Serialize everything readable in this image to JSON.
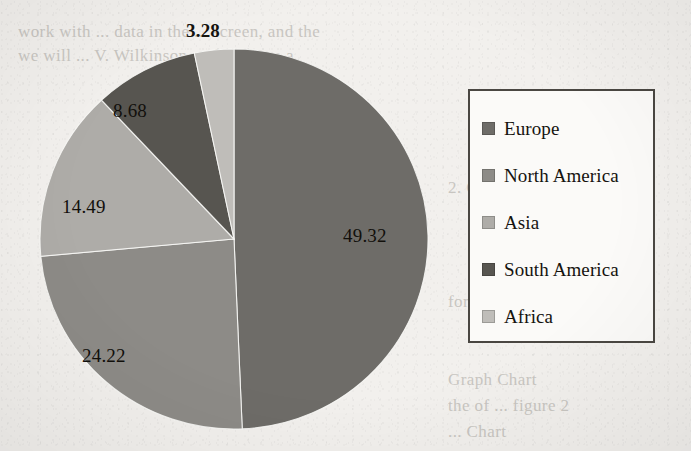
{
  "document": {
    "type": "scanned-page-with-figure",
    "background_color": "#f2f0ed",
    "bleed_through_lines": [
      {
        "text": "work with ... data in the ... screen, and the",
        "x": 18,
        "y": 22,
        "size": 17
      },
      {
        "text": "we will ... V. Wilkinson ... data learn a",
        "x": 18,
        "y": 46,
        "size": 17
      },
      {
        "text": "2. GRAPH A",
        "x": 448,
        "y": 178,
        "size": 17
      },
      {
        "text": "for all ... the",
        "x": 448,
        "y": 292,
        "size": 17
      },
      {
        "text": "Graph      Chart",
        "x": 448,
        "y": 370,
        "size": 17
      },
      {
        "text": "the    of    ... figure 2",
        "x": 448,
        "y": 396,
        "size": 17
      },
      {
        "text": "... Chart",
        "x": 448,
        "y": 422,
        "size": 17
      }
    ]
  },
  "chart_data": {
    "type": "pie",
    "title": "",
    "categories": [
      "Europe",
      "North America",
      "Asia",
      "South America",
      "Africa"
    ],
    "values": [
      49.32,
      24.22,
      14.49,
      8.68,
      3.28
    ],
    "value_labels": [
      "49.32",
      "24.22",
      "14.49",
      "8.68",
      "3.28"
    ],
    "unit": "percent",
    "total": 99.99,
    "colors": [
      "#6e6c68",
      "#8d8b87",
      "#aeaca8",
      "#575550",
      "#bfbdb9"
    ],
    "start_angle_deg": 0,
    "direction": "clockwise",
    "legend": {
      "position": "right",
      "border_color": "#4a4742",
      "background": "#fbfaf8",
      "entries": [
        {
          "label": "Europe",
          "color": "#6e6c68"
        },
        {
          "label": "North America",
          "color": "#8d8b87"
        },
        {
          "label": "Asia",
          "color": "#aeaca8"
        },
        {
          "label": "South America",
          "color": "#575550"
        },
        {
          "label": "Africa",
          "color": "#bfbdb9"
        }
      ]
    },
    "labels_layout": [
      {
        "text": "49.32",
        "x": 343,
        "y": 225,
        "placement": "inside"
      },
      {
        "text": "24.22",
        "x": 82,
        "y": 345,
        "placement": "inside"
      },
      {
        "text": "14.49",
        "x": 62,
        "y": 196,
        "placement": "inside"
      },
      {
        "text": "8.68",
        "x": 113,
        "y": 100,
        "placement": "inside"
      },
      {
        "text": "3.28",
        "x": 186,
        "y": 20,
        "placement": "outside-top"
      }
    ],
    "grid": false,
    "xlabel": "",
    "ylabel": ""
  }
}
